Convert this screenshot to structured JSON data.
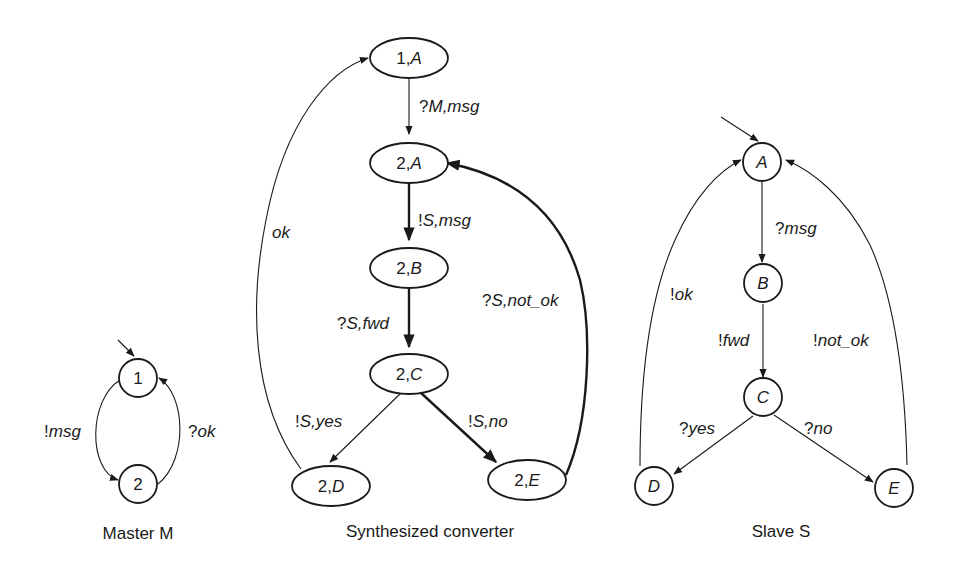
{
  "diagrams": [
    {
      "id": "master",
      "caption": "Master M",
      "states": [
        {
          "id": "1",
          "label": "1",
          "initial": true
        },
        {
          "id": "2",
          "label": "2"
        }
      ],
      "transitions": [
        {
          "from": "1",
          "to": "2",
          "label": "!msg"
        },
        {
          "from": "2",
          "to": "1",
          "label": "?ok"
        }
      ]
    },
    {
      "id": "converter",
      "caption": "Synthesized converter",
      "states": [
        {
          "id": "1A",
          "label_num": "1,",
          "label_letter": "A",
          "initial": true
        },
        {
          "id": "2A",
          "label_num": "2,",
          "label_letter": "A"
        },
        {
          "id": "2B",
          "label_num": "2,",
          "label_letter": "B"
        },
        {
          "id": "2C",
          "label_num": "2,",
          "label_letter": "C"
        },
        {
          "id": "2D",
          "label_num": "2,",
          "label_letter": "D"
        },
        {
          "id": "2E",
          "label_num": "2,",
          "label_letter": "E"
        }
      ],
      "transitions": [
        {
          "from": "1A",
          "to": "2A",
          "label_prefix": "?",
          "label_rest": "M,msg",
          "bold": false
        },
        {
          "from": "2A",
          "to": "2B",
          "label_prefix": "!",
          "label_rest": "S,msg",
          "bold": true
        },
        {
          "from": "2B",
          "to": "2C",
          "label_prefix": "?",
          "label_rest": "S,fwd",
          "bold": true
        },
        {
          "from": "2C",
          "to": "2D",
          "label_prefix": "!",
          "label_rest": "S,yes",
          "bold": false
        },
        {
          "from": "2C",
          "to": "2E",
          "label_prefix": "!",
          "label_rest": "S,no",
          "bold": true
        },
        {
          "from": "2D",
          "to": "1A",
          "label_prefix": "",
          "label_rest": "ok",
          "bold": false
        },
        {
          "from": "2E",
          "to": "2A",
          "label_prefix": "?",
          "label_rest": "S,not_ok",
          "bold": true
        }
      ]
    },
    {
      "id": "slave",
      "caption": "Slave S",
      "states": [
        {
          "id": "A",
          "label": "A",
          "initial": true
        },
        {
          "id": "B",
          "label": "B"
        },
        {
          "id": "C",
          "label": "C"
        },
        {
          "id": "D",
          "label": "D"
        },
        {
          "id": "E",
          "label": "E"
        }
      ],
      "transitions": [
        {
          "from": "A",
          "to": "B",
          "label_prefix": "?",
          "label_rest": "msg"
        },
        {
          "from": "B",
          "to": "C",
          "label_prefix": "!",
          "label_rest": "fwd"
        },
        {
          "from": "C",
          "to": "D",
          "label_prefix": "?",
          "label_rest": "yes"
        },
        {
          "from": "C",
          "to": "E",
          "label_prefix": "?",
          "label_rest": "no"
        },
        {
          "from": "D",
          "to": "A",
          "label_prefix": "!",
          "label_rest": "ok"
        },
        {
          "from": "E",
          "to": "A",
          "label_prefix": "!",
          "label_rest": "not_ok"
        }
      ]
    }
  ],
  "colors": {
    "ink": "#1a1a1a",
    "background": "#ffffff"
  }
}
